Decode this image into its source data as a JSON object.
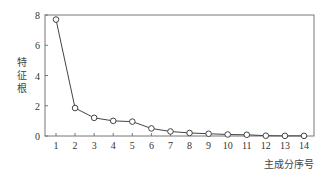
{
  "chart_data": {
    "type": "line",
    "title": "",
    "xlabel": "主成分序号",
    "ylabel": "特征根",
    "ylabel_chars": [
      "特",
      "征",
      "根"
    ],
    "x": [
      1,
      2,
      3,
      4,
      5,
      6,
      7,
      8,
      9,
      10,
      11,
      12,
      13,
      14
    ],
    "categories": [
      "1",
      "2",
      "3",
      "4",
      "5",
      "6",
      "7",
      "8",
      "9",
      "10",
      "11",
      "12",
      "13",
      "14"
    ],
    "series": [
      {
        "name": "特征根",
        "values": [
          7.7,
          1.85,
          1.2,
          1.0,
          0.95,
          0.5,
          0.3,
          0.2,
          0.15,
          0.1,
          0.08,
          0.02,
          0.01,
          0.01
        ],
        "marker": "circle-open"
      }
    ],
    "ylim": [
      0,
      8
    ],
    "yticks": [
      0,
      2,
      4,
      6,
      8
    ],
    "xticks": [
      1,
      2,
      3,
      4,
      5,
      6,
      7,
      8,
      9,
      10,
      11,
      12,
      13,
      14
    ],
    "grid": false,
    "legend": "none"
  },
  "colors": {
    "line": "#444444",
    "axis": "#666666",
    "text": "#333333"
  }
}
